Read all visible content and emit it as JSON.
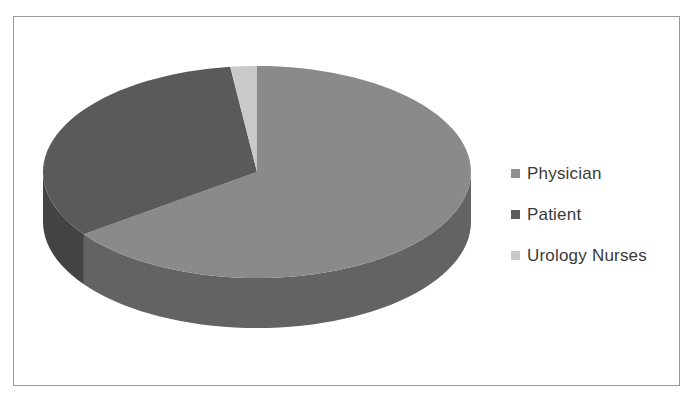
{
  "chart_data": {
    "type": "pie",
    "style": "3d",
    "title": "",
    "categories": [
      "Physician",
      "Patient",
      "Urology Nurses"
    ],
    "values": [
      65,
      33,
      2
    ],
    "unit": "percent (estimated)",
    "colors": {
      "Physician": {
        "top": "#8a8a8a",
        "side": "#636363"
      },
      "Patient": {
        "top": "#5a5a5a",
        "side": "#434343"
      },
      "Urology Nurses": {
        "top": "#c9c9c9",
        "side": "#a5a5a5"
      }
    },
    "start_angle_deg": 0,
    "direction": "clockwise",
    "legend_position": "right"
  },
  "legend": {
    "items": [
      {
        "label": "Physician",
        "color": "#8f8f8f"
      },
      {
        "label": "Patient",
        "color": "#5c5c5c"
      },
      {
        "label": "Urology Nurses",
        "color": "#c8c8c8"
      }
    ]
  },
  "frame": {
    "border_color": "#9a9a9a"
  }
}
